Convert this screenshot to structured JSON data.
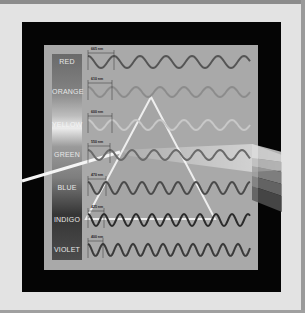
{
  "diagram": {
    "bands": [
      {
        "name": "RED",
        "wavelength": "665 nm",
        "color": "#6e6e6e",
        "wave_color": "#555555",
        "cy": 62,
        "period": 26,
        "amp": 6
      },
      {
        "name": "ORANGE",
        "wavelength": "610 nm",
        "color": "#909090",
        "wave_color": "#8c8c8c",
        "cy": 92,
        "period": 24,
        "amp": 5
      },
      {
        "name": "YELLOW",
        "wavelength": "600 nm",
        "color": "#d6d6d6",
        "wave_color": "#c8c8c8",
        "cy": 125,
        "period": 24,
        "amp": 5
      },
      {
        "name": "GREEN",
        "wavelength": "550 nm",
        "color": "#8a8a8a",
        "wave_color": "#6a6a6a",
        "cy": 155,
        "period": 22,
        "amp": 5
      },
      {
        "name": "BLUE",
        "wavelength": "470 nm",
        "color": "#7a7a7a",
        "wave_color": "#4a4a4a",
        "cy": 188,
        "period": 18,
        "amp": 6
      },
      {
        "name": "INDIGO",
        "wavelength": "425 nm",
        "color": "#3a3a3a",
        "wave_color": "#2c2c2c",
        "cy": 220,
        "period": 16,
        "amp": 6
      },
      {
        "name": "VIOLET",
        "wavelength": "400 nm",
        "color": "#4a4a4a",
        "wave_color": "#3a3a3a",
        "cy": 250,
        "period": 15,
        "amp": 6
      }
    ],
    "colors": {
      "page_bg": "#e3e3e3",
      "black_frame": "#050505",
      "panel": "#a9a9a9",
      "beam": "#f5f5f5",
      "prism_edge": "#eeeeee"
    }
  }
}
